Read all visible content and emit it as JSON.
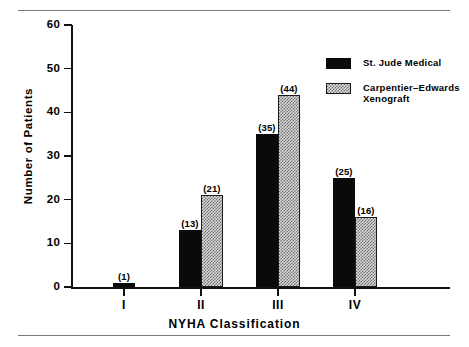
{
  "chart_data": {
    "type": "bar",
    "title": "",
    "xlabel": "NYHA Classification",
    "ylabel": "Number of Patients",
    "categories": [
      "I",
      "II",
      "III",
      "IV"
    ],
    "series": [
      {
        "name": "St. Jude Medical",
        "values": [
          1,
          13,
          35,
          25
        ],
        "pattern": "solid",
        "color": "#0a0a0a"
      },
      {
        "name": "Carpentier-Edwards\nXenograft",
        "values": [
          null,
          21,
          44,
          16
        ],
        "pattern": "hatched",
        "color": "#d9d9d9"
      }
    ],
    "data_labels": {
      "I": [
        "(1)",
        null
      ],
      "II": [
        "(13)",
        "(21)"
      ],
      "III": [
        "(35)",
        "(44)"
      ],
      "IV": [
        "(25)",
        "(16)"
      ]
    },
    "ylim": [
      0,
      60
    ],
    "yticks": [
      0,
      10,
      20,
      30,
      40,
      50,
      60
    ],
    "ytick_labels": [
      "0",
      "10",
      "20",
      "30",
      "40",
      "50",
      "60"
    ],
    "grid": false,
    "legend_position": "upper right"
  },
  "axes": {
    "y_title": "Number of Patients",
    "x_title": "NYHA Classification"
  },
  "legend": {
    "entries": [
      {
        "label": "St. Jude Medical",
        "swatch": "solid-black-swatch"
      },
      {
        "label": "Carpentier–Edwards\nXenograft",
        "swatch": "hatched-gray-swatch"
      }
    ]
  }
}
